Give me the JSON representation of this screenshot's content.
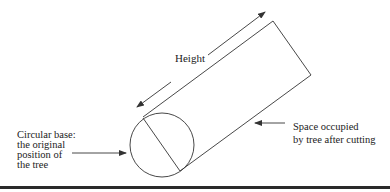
{
  "diagram": {
    "labels": {
      "height": "Height",
      "base_line1": "Circular base:",
      "base_line2": "the original",
      "base_line3": "position of",
      "base_line4": "the tree",
      "space_line1": "Space occupied",
      "space_line2": "by tree after cutting"
    },
    "shapes": {
      "circle": {
        "cx": 162,
        "cy": 145,
        "r": 32
      },
      "fallen_tree_rectangle": {
        "corners": [
          [
            143,
            117
          ],
          [
            273,
            21
          ],
          [
            311,
            75
          ],
          [
            180,
            171
          ]
        ]
      }
    },
    "colors": {
      "stroke": "#333333",
      "background": "#ffffff",
      "rule": "#2a2a2a"
    }
  }
}
